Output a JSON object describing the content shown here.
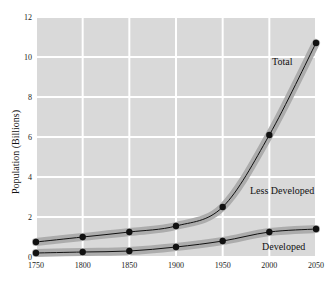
{
  "chart_data": {
    "type": "line",
    "title": "",
    "xlabel": "",
    "ylabel": "Population (Billions)",
    "x": [
      1750,
      1800,
      1850,
      1900,
      1950,
      2000,
      2050
    ],
    "xlim": [
      1750,
      2050
    ],
    "ylim": [
      0,
      12
    ],
    "xticks": [
      "1750",
      "1800",
      "1850",
      "1900",
      "1950",
      "2000",
      "2050"
    ],
    "yticks": [
      "0",
      "2",
      "4",
      "6",
      "8",
      "10",
      "12"
    ],
    "grid": true,
    "legend": "inline labels",
    "series": [
      {
        "name": "Total",
        "values": [
          0.75,
          1.0,
          1.25,
          1.55,
          2.5,
          6.1,
          10.7
        ]
      },
      {
        "name": "Developed",
        "values": [
          0.2,
          0.25,
          0.3,
          0.5,
          0.8,
          1.25,
          1.4
        ]
      }
    ],
    "annotations": [
      {
        "text": "Total",
        "region": "between 2000 and 2050 near total curve, y≈10"
      },
      {
        "text": "Less Developed",
        "region": "gap between Total and Developed, y≈2.7"
      },
      {
        "text": "Developed",
        "region": "below developed curve, y≈0.6"
      }
    ]
  },
  "labels": {
    "total": "Total",
    "less_developed": "Less Developed",
    "developed": "Developed"
  },
  "colors": {
    "plot_bg": "#d9d9d9",
    "grid": "#ffffff",
    "band": "#a6a6a6",
    "line": "#111111"
  }
}
